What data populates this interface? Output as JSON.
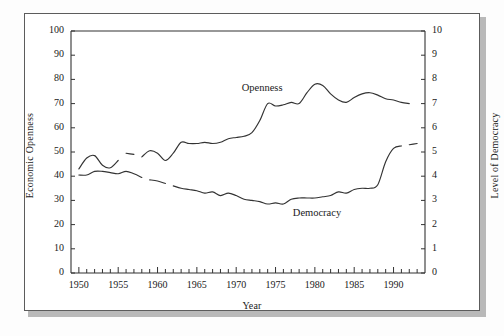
{
  "figure": {
    "background": "#ffffff",
    "frame_color": "#5c5c5c",
    "shadow_color": "#b9b9b9",
    "line_color": "#333333"
  },
  "chart_data": {
    "type": "line",
    "title": "",
    "subtitle": "",
    "xlabel": "Year",
    "ylabel": "Economic Openness",
    "y2label": "Level of Democracy",
    "xlim": [
      1949,
      1994
    ],
    "ylim": [
      0,
      100
    ],
    "y2lim": [
      0,
      10
    ],
    "grid": false,
    "legend": "inline-annotations",
    "x_ticks_major": [
      1950,
      1955,
      1960,
      1965,
      1970,
      1975,
      1980,
      1985,
      1990
    ],
    "x_tick_labels": [
      "1950",
      "1955",
      "1960",
      "1965",
      "1970",
      "1975",
      "1980",
      "1985",
      "1990"
    ],
    "x_ticks_minor_step": 1,
    "y_ticks": [
      0,
      10,
      20,
      30,
      40,
      50,
      60,
      70,
      80,
      90,
      100
    ],
    "y_tick_labels": [
      "0",
      "10",
      "20",
      "30",
      "40",
      "50",
      "60",
      "70",
      "80",
      "90",
      "100"
    ],
    "y2_ticks": [
      0,
      1,
      2,
      3,
      4,
      5,
      6,
      7,
      8,
      9,
      10
    ],
    "y2_tick_labels": [
      "0",
      "1",
      "2",
      "3",
      "4",
      "5",
      "6",
      "7",
      "8",
      "9",
      "10"
    ],
    "annotations": [
      {
        "text": "Openness",
        "x": 1974.0,
        "y": 75.5,
        "axis": "left"
      },
      {
        "text": "Democracy",
        "x": 1980.5,
        "y": 24.0,
        "axis": "left"
      }
    ],
    "series": [
      {
        "name": "Openness",
        "axis": "left",
        "units": "Economic Openness index (0-100)",
        "segments": [
          {
            "x": [
              1950,
              1951,
              1952,
              1953,
              1954,
              1955
            ],
            "values": [
              43.0,
              47.5,
              48.5,
              44.5,
              43.5,
              46.5
            ]
          },
          {
            "x": [
              1956,
              1957
            ],
            "values": [
              49.5,
              49.0
            ]
          },
          {
            "x": [
              1958,
              1959,
              1960,
              1961,
              1962,
              1963,
              1964,
              1965,
              1966,
              1967,
              1968,
              1969,
              1970,
              1971,
              1972,
              1973,
              1974,
              1975,
              1976,
              1977,
              1978,
              1979,
              1980,
              1981,
              1982,
              1983,
              1984,
              1985,
              1986,
              1987,
              1988,
              1989,
              1990,
              1991,
              1992
            ],
            "values": [
              48.0,
              50.5,
              49.5,
              46.5,
              49.5,
              54.0,
              53.5,
              53.5,
              54.0,
              53.5,
              54.0,
              55.5,
              56.0,
              56.5,
              58.0,
              63.0,
              70.0,
              69.0,
              69.5,
              70.5,
              70.0,
              74.5,
              78.0,
              77.5,
              74.0,
              71.5,
              70.5,
              72.5,
              74.0,
              74.5,
              73.5,
              72.0,
              71.5,
              70.5,
              70.0
            ]
          }
        ]
      },
      {
        "name": "Democracy",
        "axis": "right",
        "units": "Polity level of democracy (0-10)",
        "segments": [
          {
            "x": [
              1950,
              1951,
              1952,
              1953,
              1954,
              1955,
              1956,
              1957,
              1958
            ],
            "values": [
              4.05,
              4.05,
              4.2,
              4.2,
              4.15,
              4.1,
              4.2,
              4.1,
              3.95
            ]
          },
          {
            "x": [
              1959,
              1960,
              1961
            ],
            "values": [
              3.85,
              3.8,
              3.7
            ]
          },
          {
            "x": [
              1962,
              1963,
              1964,
              1965,
              1966,
              1967,
              1968,
              1969,
              1970,
              1971,
              1972,
              1973,
              1974,
              1975,
              1976,
              1977,
              1978,
              1979,
              1980,
              1981,
              1982,
              1983,
              1984,
              1985,
              1986,
              1987,
              1988,
              1989,
              1990,
              1991
            ],
            "values": [
              3.6,
              3.5,
              3.45,
              3.4,
              3.3,
              3.35,
              3.2,
              3.3,
              3.2,
              3.05,
              3.0,
              2.95,
              2.85,
              2.9,
              2.85,
              3.05,
              3.1,
              3.1,
              3.1,
              3.15,
              3.2,
              3.35,
              3.3,
              3.45,
              3.5,
              3.5,
              3.65,
              4.6,
              5.15,
              5.25
            ]
          },
          {
            "x": [
              1992,
              1993
            ],
            "values": [
              5.3,
              5.35
            ]
          }
        ]
      }
    ]
  },
  "labels": {
    "xlabel": "Year",
    "ylabel_left": "Economic Openness",
    "ylabel_right": "Level of Democracy",
    "series_openness": "Openness",
    "series_democracy": "Democracy"
  }
}
